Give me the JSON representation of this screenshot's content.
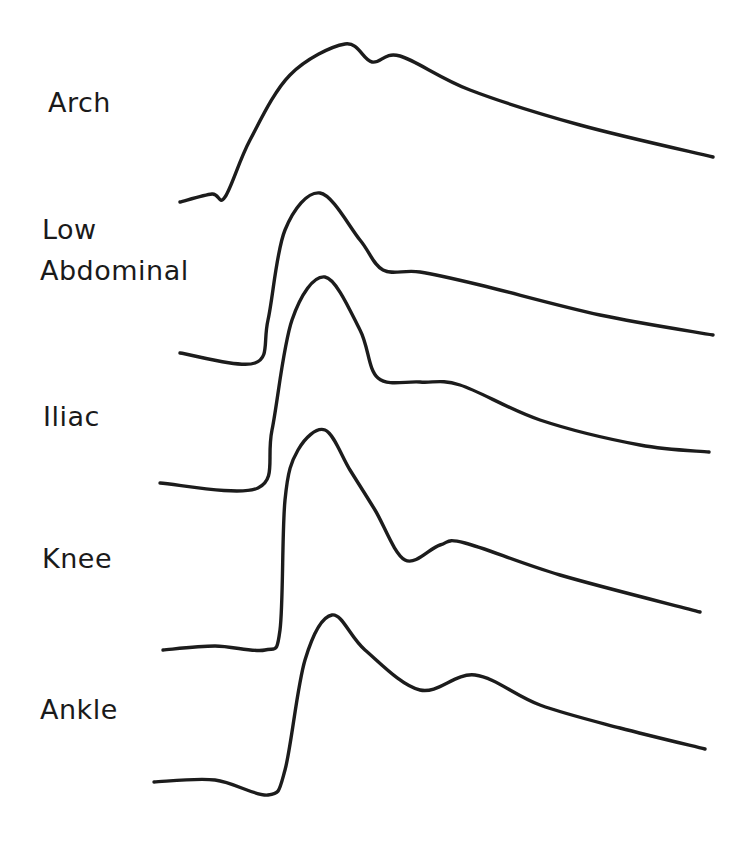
{
  "figure": {
    "title": "",
    "labels": {
      "arch": "Arch",
      "low_abdominal_line1": "Low",
      "low_abdominal_line2": "Abdominal",
      "iliac": "Iliac",
      "knee": "Knee",
      "ankle": "Ankle"
    },
    "stroke_color": "#1c1c1c",
    "background": "#ffffff"
  },
  "chart_data": {
    "type": "line",
    "title": "",
    "xlabel": "",
    "ylabel": "",
    "axes_visible": false,
    "grid": false,
    "legend": "none (labels placed left of each trace)",
    "series": [
      {
        "name": "Arch",
        "points": [
          [
            180,
            202
          ],
          [
            212,
            194
          ],
          [
            225,
            197
          ],
          [
            250,
            140
          ],
          [
            290,
            75
          ],
          [
            345,
            44
          ],
          [
            372,
            62
          ],
          [
            400,
            56
          ],
          [
            470,
            90
          ],
          [
            580,
            125
          ],
          [
            713,
            157
          ]
        ]
      },
      {
        "name": "Low Abdominal",
        "points": [
          [
            180,
            353
          ],
          [
            255,
            363
          ],
          [
            268,
            320
          ],
          [
            285,
            230
          ],
          [
            320,
            193
          ],
          [
            360,
            240
          ],
          [
            383,
            270
          ],
          [
            420,
            272
          ],
          [
            480,
            285
          ],
          [
            600,
            315
          ],
          [
            713,
            335
          ]
        ]
      },
      {
        "name": "Iliac",
        "points": [
          [
            160,
            483
          ],
          [
            258,
            488
          ],
          [
            272,
            430
          ],
          [
            292,
            320
          ],
          [
            325,
            277
          ],
          [
            360,
            330
          ],
          [
            378,
            378
          ],
          [
            420,
            382
          ],
          [
            460,
            385
          ],
          [
            540,
            420
          ],
          [
            640,
            445
          ],
          [
            709,
            452
          ]
        ]
      },
      {
        "name": "Knee",
        "points": [
          [
            163,
            650
          ],
          [
            215,
            646
          ],
          [
            265,
            650
          ],
          [
            280,
            630
          ],
          [
            285,
            500
          ],
          [
            298,
            450
          ],
          [
            325,
            430
          ],
          [
            350,
            470
          ],
          [
            375,
            510
          ],
          [
            405,
            560
          ],
          [
            440,
            545
          ],
          [
            465,
            543
          ],
          [
            560,
            575
          ],
          [
            700,
            612
          ]
        ]
      },
      {
        "name": "Ankle",
        "points": [
          [
            154,
            782
          ],
          [
            215,
            780
          ],
          [
            268,
            795
          ],
          [
            285,
            770
          ],
          [
            305,
            660
          ],
          [
            332,
            615
          ],
          [
            365,
            650
          ],
          [
            420,
            690
          ],
          [
            475,
            675
          ],
          [
            540,
            705
          ],
          [
            620,
            728
          ],
          [
            705,
            749
          ]
        ]
      }
    ]
  }
}
